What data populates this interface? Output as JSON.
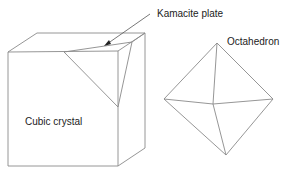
{
  "labels": {
    "kamacite": "Kamacite plate",
    "octahedron": "Octahedron",
    "cubic": "Cubic crystal"
  },
  "colors": {
    "edge": "#8a8a8a",
    "text": "#222222",
    "background": "#ffffff"
  }
}
